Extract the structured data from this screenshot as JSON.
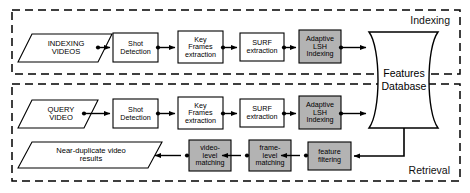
{
  "diagram": {
    "regions": [
      {
        "id": "indexing",
        "label": "Indexing"
      },
      {
        "id": "retrieval",
        "label": "Retrieval"
      }
    ],
    "colors": {
      "stroke": "#000000",
      "background": "#ffffff",
      "shaded_fill": "#b3b3b3",
      "plain_fill": "#ffffff"
    },
    "nodes": {
      "indexing_videos": {
        "label": "INDEXING\nVIDEOS",
        "shape": "parallelogram",
        "fill": "plain"
      },
      "shot_detection_idx": {
        "label": "Shot\nDetection",
        "shape": "rect",
        "fill": "plain"
      },
      "key_frames_idx": {
        "label": "Key\nFrames\nextraction",
        "shape": "rect",
        "fill": "plain"
      },
      "surf_idx": {
        "label": "SURF\nextraction",
        "shape": "rect",
        "fill": "plain"
      },
      "lsh_idx": {
        "label": "Adaptive\nLSH\nIndexing",
        "shape": "rect",
        "fill": "shaded"
      },
      "features_database": {
        "label": "Features\nDatabase",
        "shape": "datastore",
        "fill": "plain"
      },
      "query_video": {
        "label": "QUERY\nVIDEO",
        "shape": "parallelogram",
        "fill": "plain"
      },
      "shot_detection_qry": {
        "label": "Shot\nDetection",
        "shape": "rect",
        "fill": "plain"
      },
      "key_frames_qry": {
        "label": "Key\nFrames\nextraction",
        "shape": "rect",
        "fill": "plain"
      },
      "surf_qry": {
        "label": "SURF\nextraction",
        "shape": "rect",
        "fill": "plain"
      },
      "lsh_qry": {
        "label": "Adaptive\nLSH\nIndexing",
        "shape": "rect",
        "fill": "shaded"
      },
      "feature_filtering": {
        "label": "feature\nfiltering",
        "shape": "rect",
        "fill": "shaded"
      },
      "frame_level_matching": {
        "label": "frame-\nlevel\nmatching",
        "shape": "rect",
        "fill": "shaded"
      },
      "video_level_matching": {
        "label": "video-\nlevel\nmatching",
        "shape": "rect",
        "fill": "shaded"
      },
      "results": {
        "label": "Near-duplicate video\nresults",
        "shape": "parallelogram",
        "fill": "plain"
      }
    },
    "edges": [
      {
        "from": "indexing_videos",
        "to": "shot_detection_idx"
      },
      {
        "from": "shot_detection_idx",
        "to": "key_frames_idx"
      },
      {
        "from": "key_frames_idx",
        "to": "surf_idx"
      },
      {
        "from": "surf_idx",
        "to": "lsh_idx"
      },
      {
        "from": "lsh_idx",
        "to": "features_database"
      },
      {
        "from": "query_video",
        "to": "shot_detection_qry"
      },
      {
        "from": "shot_detection_qry",
        "to": "key_frames_qry"
      },
      {
        "from": "key_frames_qry",
        "to": "surf_qry"
      },
      {
        "from": "surf_qry",
        "to": "lsh_qry"
      },
      {
        "from": "lsh_qry",
        "to": "features_database"
      },
      {
        "from": "features_database",
        "to": "feature_filtering"
      },
      {
        "from": "feature_filtering",
        "to": "frame_level_matching"
      },
      {
        "from": "frame_level_matching",
        "to": "video_level_matching"
      },
      {
        "from": "video_level_matching",
        "to": "results"
      }
    ]
  }
}
